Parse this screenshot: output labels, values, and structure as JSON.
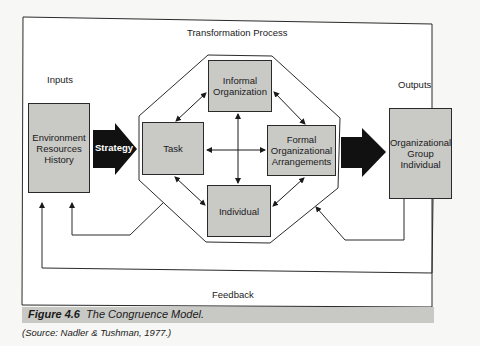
{
  "figure": {
    "title": "The Congruence Model",
    "number_label": "Figure 4.6",
    "title_label": "The Congruence Model.",
    "source": "(Source: Nadler & Tushman, 1977.)"
  },
  "labels": {
    "inputs": "Inputs",
    "transformation": "Transformation Process",
    "outputs": "Outputs",
    "feedback": "Feedback",
    "strategy": "Strategy"
  },
  "inputs_box": {
    "lines": [
      "Environment",
      "Resources",
      "History"
    ]
  },
  "components": {
    "informal": {
      "lines": [
        "Informal",
        "Organization"
      ]
    },
    "task": {
      "lines": [
        "Task"
      ]
    },
    "formal": {
      "lines": [
        "Formal",
        "Organizational",
        "Arrangements"
      ]
    },
    "individual": {
      "lines": [
        "Individual"
      ]
    }
  },
  "outputs_box": {
    "lines": [
      "Organizational",
      "Group",
      "Individual"
    ]
  },
  "colors": {
    "box_fill": "#c9c9c6",
    "arrow_fill": "#111111",
    "line": "#2a2a2a",
    "caption_band": "#c8c8c4"
  }
}
